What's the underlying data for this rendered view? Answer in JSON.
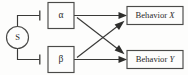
{
  "diagram": {
    "background_color": "#fdfdfc",
    "line_color": "#3a3a38",
    "text_color": "#2a2a2a",
    "nodes": {
      "source": {
        "id": "S",
        "label": "S",
        "shape": "circle",
        "name": "stimulus-source"
      },
      "process_alpha": {
        "id": "alpha",
        "label": "α",
        "shape": "rectangle",
        "name": "process-alpha"
      },
      "process_beta": {
        "id": "beta",
        "label": "β",
        "shape": "rectangle",
        "name": "process-beta"
      },
      "behavior_x": {
        "id": "behavior_x",
        "label_prefix": "Behavior ",
        "label_variable": "X",
        "shape": "rectangle",
        "name": "behavior-x"
      },
      "behavior_y": {
        "id": "behavior_y",
        "label_prefix": "Behavior ",
        "label_variable": "Y",
        "shape": "rectangle",
        "name": "behavior-y"
      }
    },
    "edges": [
      {
        "from": "S",
        "to": "alpha",
        "terminator": "bar",
        "meaning": "inhibition"
      },
      {
        "from": "S",
        "to": "beta",
        "terminator": "bar",
        "meaning": "inhibition"
      },
      {
        "from": "alpha",
        "to": "behavior_x",
        "terminator": "arrow",
        "meaning": "excitation"
      },
      {
        "from": "alpha",
        "to": "behavior_y",
        "terminator": "arrow",
        "meaning": "excitation"
      },
      {
        "from": "beta",
        "to": "behavior_y",
        "terminator": "arrow",
        "meaning": "excitation"
      },
      {
        "from": "beta",
        "to": "behavior_x",
        "terminator": "arrow",
        "meaning": "excitation"
      }
    ]
  }
}
